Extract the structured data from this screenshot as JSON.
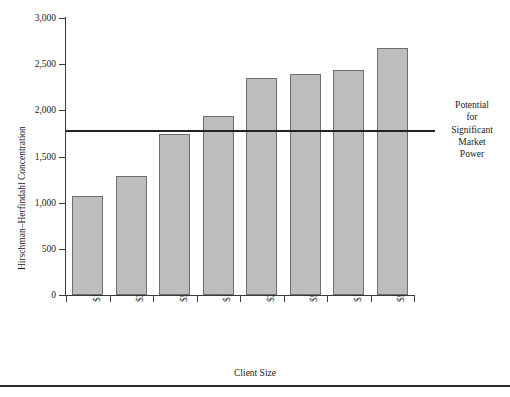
{
  "chart_data": {
    "type": "bar",
    "title": "",
    "xlabel": "Client Size",
    "ylabel": "Hirschman–Herfindahl Concentration",
    "categories": [
      "$1–$25",
      "$25–$50",
      "$50–100",
      "$100–$250",
      "$250–$500",
      "$500–$1,000",
      "$1,000–$5,000",
      "$5,000"
    ],
    "values": [
      1070,
      1290,
      1745,
      1940,
      2350,
      2390,
      2440,
      2670
    ],
    "ylim": [
      0,
      3000
    ],
    "ytick_values": [
      0,
      500,
      1000,
      1500,
      2000,
      2500,
      3000
    ],
    "ytick_labels": [
      "0",
      "500",
      "1,000",
      "1,500",
      "2,000",
      "2,500",
      "3,000"
    ],
    "grid": false,
    "legend": "none",
    "bar_color": "#bdbdbd",
    "bar_edge_color": "#6e6e6e",
    "axis_color": "#3b3b3b",
    "annotations": [
      {
        "name": "threshold-line",
        "type": "hline",
        "value": 1780,
        "label_lines": [
          "Potential",
          "for",
          "Significant",
          "Market",
          "Power"
        ],
        "label_text": "Potential for Significant Market Power",
        "color": "#222222"
      }
    ]
  }
}
